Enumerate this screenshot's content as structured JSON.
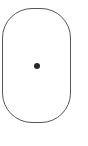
{
  "shape": {
    "type": "rounded-rectangle",
    "stroke_color": "#555555",
    "fill_color": "#ffffff"
  },
  "center_dot": {
    "color": "#2a2a2a"
  }
}
